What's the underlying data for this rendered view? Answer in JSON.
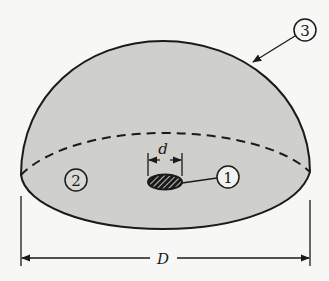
{
  "figure": {
    "colors": {
      "background": "#f7f7f5",
      "fill": "#cfcfcc",
      "stroke": "#1a1a1a"
    },
    "labels": {
      "callout_1": "1",
      "callout_2": "2",
      "callout_3": "3",
      "dimension_small": "d",
      "dimension_large": "D"
    }
  }
}
